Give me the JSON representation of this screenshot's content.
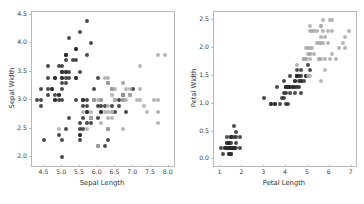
{
  "figure": {
    "background_color": "#ffffff",
    "spine_color": "#b8b8b8",
    "tick_label_color": "#3a3a3a",
    "axis_label_color": "#2f2f2f",
    "dark_point_color": "#2b2b2b",
    "light_point_color": "#a9a9a9"
  },
  "chart_data": [
    {
      "type": "scatter",
      "title": "",
      "xlabel": "Sepal Length",
      "ylabel": "Sepal Width",
      "xlim": [
        4.15,
        8.15
      ],
      "ylim": [
        1.85,
        4.55
      ],
      "xticks": [
        "4.5",
        "5.0",
        "5.5",
        "6.0",
        "6.5",
        "7.0",
        "7.5",
        "8.0"
      ],
      "xtick_values": [
        4.5,
        5.0,
        5.5,
        6.0,
        6.5,
        7.0,
        7.5,
        8.0
      ],
      "yticks": [
        "2.0",
        "2.5",
        "3.0",
        "3.5",
        "4.0",
        "4.5"
      ],
      "ytick_values": [
        2.0,
        2.5,
        3.0,
        3.5,
        4.0,
        4.5
      ],
      "grid": false,
      "legend": "none",
      "series": [
        {
          "name": "dark-group",
          "color": "#2b2b2b",
          "x": [
            5.1,
            4.9,
            4.7,
            4.6,
            5.0,
            5.4,
            4.6,
            5.0,
            4.4,
            4.9,
            5.4,
            4.8,
            4.8,
            4.3,
            5.8,
            5.7,
            5.4,
            5.1,
            5.7,
            5.1,
            5.4,
            5.1,
            4.6,
            5.1,
            4.8,
            5.0,
            5.0,
            5.2,
            5.2,
            4.7,
            4.8,
            5.4,
            5.2,
            5.5,
            4.9,
            5.0,
            5.5,
            4.9,
            4.4,
            5.1,
            5.0,
            4.5,
            4.4,
            5.0,
            5.1,
            4.8,
            5.1,
            4.6,
            5.3,
            5.0,
            7.0,
            6.4,
            6.9,
            5.5,
            6.5,
            5.7,
            6.3,
            4.9,
            6.6,
            5.2,
            5.0,
            5.9,
            6.0,
            6.1,
            5.6,
            6.7,
            5.6,
            5.8,
            6.2,
            5.6,
            5.9,
            6.1,
            6.3,
            6.1,
            6.4,
            6.6,
            6.8,
            6.7,
            6.0,
            5.7,
            5.5,
            5.5,
            5.8,
            6.0,
            5.4,
            6.0,
            6.7,
            6.3,
            5.6,
            5.5,
            5.5,
            6.1,
            5.8,
            5.0,
            5.6,
            5.7,
            5.7,
            6.2,
            5.1,
            5.7
          ],
          "y": [
            3.5,
            3.0,
            3.2,
            3.1,
            3.6,
            3.9,
            3.4,
            3.4,
            2.9,
            3.1,
            3.7,
            3.4,
            3.0,
            3.0,
            4.0,
            4.4,
            3.9,
            3.5,
            3.8,
            3.8,
            3.4,
            3.7,
            3.6,
            3.3,
            3.4,
            3.0,
            3.4,
            3.5,
            3.4,
            3.2,
            3.1,
            3.4,
            4.1,
            4.2,
            3.1,
            3.2,
            3.5,
            3.6,
            3.0,
            3.4,
            3.5,
            2.3,
            3.2,
            3.5,
            3.8,
            3.0,
            3.8,
            3.2,
            3.7,
            3.3,
            3.2,
            3.2,
            3.1,
            2.3,
            2.8,
            2.8,
            3.3,
            2.4,
            2.9,
            2.7,
            2.0,
            3.0,
            2.2,
            2.9,
            2.9,
            3.1,
            3.0,
            2.7,
            2.2,
            2.5,
            3.2,
            2.8,
            2.5,
            2.8,
            2.9,
            3.0,
            2.8,
            3.0,
            2.9,
            2.6,
            2.4,
            2.4,
            2.7,
            2.7,
            3.0,
            3.4,
            3.1,
            2.3,
            3.0,
            2.5,
            2.6,
            3.0,
            2.6,
            2.3,
            2.7,
            3.0,
            2.9,
            2.9,
            2.5,
            2.8
          ]
        },
        {
          "name": "light-group",
          "color": "#a9a9a9",
          "x": [
            6.3,
            5.8,
            7.1,
            6.3,
            6.5,
            7.6,
            4.9,
            7.3,
            6.7,
            7.2,
            6.5,
            6.4,
            6.8,
            5.7,
            5.8,
            6.4,
            6.5,
            7.7,
            7.7,
            6.0,
            6.9,
            5.6,
            7.7,
            6.3,
            6.7,
            7.2,
            6.2,
            6.1,
            6.4,
            7.2,
            7.4,
            7.9,
            6.4,
            6.3,
            6.1,
            7.7,
            6.3,
            6.4,
            6.0,
            6.9,
            6.7,
            6.9,
            5.8,
            6.8,
            6.7,
            6.7,
            6.3,
            6.5,
            6.2,
            5.9
          ],
          "y": [
            3.3,
            2.7,
            3.0,
            2.9,
            3.0,
            3.0,
            2.5,
            2.9,
            2.5,
            3.6,
            3.2,
            2.7,
            3.0,
            2.5,
            2.8,
            3.2,
            3.0,
            3.8,
            2.6,
            2.2,
            3.2,
            2.8,
            2.8,
            2.7,
            3.3,
            3.2,
            2.8,
            3.0,
            2.8,
            3.0,
            2.8,
            3.8,
            2.8,
            2.8,
            2.6,
            3.0,
            3.4,
            3.1,
            3.0,
            3.1,
            3.1,
            3.1,
            2.7,
            3.2,
            3.3,
            3.0,
            2.5,
            3.0,
            3.4,
            3.0
          ]
        }
      ]
    },
    {
      "type": "scatter",
      "title": "",
      "xlabel": "Petal Length",
      "ylabel": "Petal Width",
      "xlim": [
        0.7,
        7.2
      ],
      "ylim": [
        -0.12,
        2.65
      ],
      "xticks": [
        "1",
        "2",
        "3",
        "4",
        "5",
        "6",
        "7"
      ],
      "xtick_values": [
        1,
        2,
        3,
        4,
        5,
        6,
        7
      ],
      "yticks": [
        "0.0",
        "0.5",
        "1.0",
        "1.5",
        "2.0",
        "2.5"
      ],
      "ytick_values": [
        0.0,
        0.5,
        1.0,
        1.5,
        2.0,
        2.5
      ],
      "grid": false,
      "legend": "none",
      "series": [
        {
          "name": "dark-group",
          "color": "#2b2b2b",
          "x": [
            1.4,
            1.4,
            1.3,
            1.5,
            1.4,
            1.7,
            1.4,
            1.5,
            1.4,
            1.5,
            1.5,
            1.6,
            1.4,
            1.1,
            1.2,
            1.5,
            1.3,
            1.4,
            1.7,
            1.5,
            1.7,
            1.5,
            1.0,
            1.7,
            1.9,
            1.6,
            1.6,
            1.5,
            1.4,
            1.6,
            1.6,
            1.5,
            1.5,
            1.4,
            1.5,
            1.2,
            1.3,
            1.4,
            1.3,
            1.5,
            1.3,
            1.3,
            1.3,
            1.6,
            1.9,
            1.4,
            1.6,
            1.4,
            1.5,
            1.4,
            4.7,
            4.5,
            4.9,
            4.0,
            4.6,
            4.5,
            4.7,
            3.3,
            4.6,
            3.9,
            3.5,
            4.2,
            4.0,
            4.7,
            3.6,
            4.4,
            4.5,
            4.1,
            4.5,
            3.9,
            4.8,
            4.0,
            4.9,
            4.7,
            4.3,
            4.4,
            4.8,
            5.0,
            4.5,
            3.5,
            3.8,
            3.7,
            3.9,
            5.1,
            4.5,
            4.5,
            4.7,
            4.4,
            4.1,
            4.0,
            4.4,
            4.6,
            4.0,
            3.3,
            4.2,
            4.2,
            4.2,
            4.3,
            3.0,
            4.1
          ],
          "y": [
            0.2,
            0.2,
            0.2,
            0.2,
            0.2,
            0.4,
            0.3,
            0.2,
            0.2,
            0.1,
            0.2,
            0.2,
            0.1,
            0.1,
            0.2,
            0.4,
            0.4,
            0.3,
            0.3,
            0.3,
            0.2,
            0.4,
            0.2,
            0.5,
            0.2,
            0.2,
            0.4,
            0.2,
            0.2,
            0.2,
            0.2,
            0.4,
            0.1,
            0.2,
            0.2,
            0.2,
            0.2,
            0.1,
            0.2,
            0.2,
            0.3,
            0.3,
            0.2,
            0.6,
            0.4,
            0.3,
            0.2,
            0.2,
            0.2,
            0.2,
            1.4,
            1.5,
            1.5,
            1.3,
            1.5,
            1.3,
            1.6,
            1.0,
            1.3,
            1.4,
            1.0,
            1.5,
            1.0,
            1.4,
            1.3,
            1.4,
            1.5,
            1.0,
            1.5,
            1.1,
            1.8,
            1.3,
            1.5,
            1.2,
            1.3,
            1.4,
            1.4,
            1.7,
            1.5,
            1.0,
            1.1,
            1.0,
            1.2,
            1.6,
            1.5,
            1.6,
            1.5,
            1.3,
            1.3,
            1.3,
            1.2,
            1.4,
            1.2,
            1.0,
            1.3,
            1.2,
            1.3,
            1.3,
            1.1,
            1.3
          ]
        },
        {
          "name": "light-group",
          "color": "#a9a9a9",
          "x": [
            6.0,
            5.1,
            5.9,
            5.6,
            5.8,
            6.6,
            4.5,
            6.3,
            5.8,
            6.1,
            5.1,
            5.3,
            5.5,
            5.0,
            5.1,
            5.3,
            5.5,
            6.7,
            6.9,
            5.0,
            5.7,
            4.9,
            6.7,
            4.9,
            5.7,
            6.0,
            4.8,
            4.9,
            5.6,
            5.8,
            6.1,
            6.4,
            5.6,
            5.1,
            5.6,
            6.1,
            5.6,
            5.5,
            4.8,
            5.4,
            5.6,
            5.1,
            5.1,
            5.9,
            5.7,
            5.2,
            5.0,
            5.2,
            5.4,
            5.1
          ],
          "y": [
            2.5,
            1.9,
            2.1,
            1.8,
            2.2,
            2.1,
            1.7,
            1.8,
            1.8,
            2.5,
            2.0,
            1.9,
            2.1,
            2.0,
            2.4,
            2.3,
            1.8,
            2.2,
            2.3,
            1.5,
            2.3,
            2.0,
            2.0,
            1.8,
            2.1,
            1.8,
            1.8,
            1.8,
            2.1,
            1.6,
            1.9,
            2.0,
            2.2,
            1.5,
            1.4,
            2.3,
            2.4,
            1.8,
            1.8,
            2.1,
            2.4,
            2.3,
            1.9,
            2.3,
            2.5,
            2.3,
            1.9,
            2.0,
            2.3,
            1.8
          ]
        }
      ]
    }
  ]
}
